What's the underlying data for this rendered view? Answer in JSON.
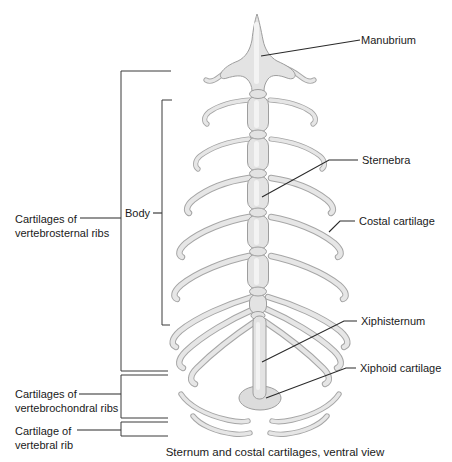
{
  "figure": {
    "caption": "Sternum and costal cartilages, ventral view",
    "right_labels": {
      "manubrium": "Manubrium",
      "sternebra": "Sternebra",
      "costal_cartilage": "Costal cartilage",
      "xiphisternum": "Xiphisternum",
      "xiphoid_cartilage": "Xiphoid cartilage"
    },
    "left_labels": {
      "body": "Body",
      "vertebrosternal_line1": "Cartilages of",
      "vertebrosternal_line2": "vertebrosternal ribs",
      "vertebrochondral_line1": "Cartilages of",
      "vertebrochondral_line2": "vertebrochondral ribs",
      "vertebral_line1": "Cartilage of",
      "vertebral_line2": "vertebral rib"
    },
    "colors": {
      "background": "#ffffff",
      "bone_fill": "#e3e3e3",
      "bone_outline": "#9e9e9e",
      "rib_core": "#e6e6e6",
      "rib_outline": "#a6a6a6",
      "leader_line": "#2a2a2a",
      "bracket_line": "#3a3a3a",
      "text": "#1a1a1a"
    }
  }
}
